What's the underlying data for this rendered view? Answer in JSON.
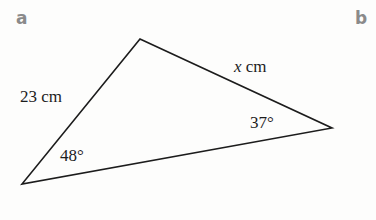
{
  "parts": {
    "a": {
      "label": "a"
    },
    "b": {
      "label": "b"
    }
  },
  "triangle": {
    "vertices": {
      "top": [
        140,
        39
      ],
      "right": [
        332,
        128
      ],
      "bottom_left": [
        22,
        184
      ]
    },
    "sides": {
      "left": {
        "label": "23 cm"
      },
      "top": {
        "variable": "x",
        "unit": " cm"
      }
    },
    "angles": {
      "bottom_left": {
        "label": "48°"
      },
      "right": {
        "label": "37°"
      }
    },
    "stroke_color": "#1c1c1c"
  }
}
